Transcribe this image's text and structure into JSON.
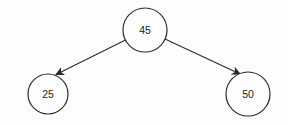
{
  "diagram": {
    "type": "binary-tree",
    "title": "",
    "colors": {
      "background": "#fdfdfd",
      "stroke": "#2b2b2b",
      "node_fill": "#fdfdfd",
      "text": "#222222"
    },
    "nodes": [
      {
        "id": "root",
        "label": "45",
        "cx": 145,
        "cy": 30,
        "r": 22
      },
      {
        "id": "left-child",
        "label": "25",
        "cx": 48,
        "cy": 94,
        "r": 20
      },
      {
        "id": "right-child",
        "label": "50",
        "cx": 248,
        "cy": 94,
        "r": 22
      }
    ],
    "edges": [
      {
        "from": "root",
        "to": "left-child",
        "x1": 125.5,
        "y1": 40,
        "x2": 56,
        "y2": 74.5,
        "arrowhead": "filled-triangle"
      },
      {
        "from": "root",
        "to": "right-child",
        "x1": 165,
        "y1": 39,
        "x2": 240,
        "y2": 74,
        "arrowhead": "filled-triangle"
      }
    ]
  }
}
